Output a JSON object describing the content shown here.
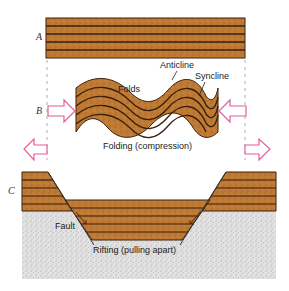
{
  "figure": {
    "sections": [
      {
        "id": "A",
        "label": "A",
        "description": "Horizontal undeformed sedimentary layers"
      },
      {
        "id": "B",
        "label": "B",
        "description": "Layers folded by compression"
      },
      {
        "id": "C",
        "label": "C",
        "description": "Layers displaced by rifting along faults"
      }
    ],
    "labels": {
      "anticline": "Anticline",
      "syncline": "Syncline",
      "folds": "Folds",
      "folding_caption": "Folding (compression)",
      "fault": "Fault",
      "rifting_caption": "Rifting (pulling apart)"
    },
    "arrows": {
      "compression": "inward (toward center)",
      "tension": "outward (away from center)"
    },
    "colors": {
      "strata_fill": "#b8732e",
      "strata_line": "#3a1f0c",
      "arrow_stroke": "#e0609a",
      "bedrock": "#d8d8d8",
      "guide_dash": "#999999"
    }
  }
}
